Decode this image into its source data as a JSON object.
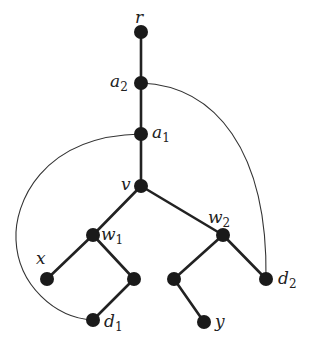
{
  "diagram": {
    "type": "rooted tree with back edges",
    "nodes": [
      {
        "id": "r",
        "label": "r",
        "sub": "",
        "x": 141,
        "y": 32
      },
      {
        "id": "a2",
        "label": "a",
        "sub": "2",
        "x": 141,
        "y": 83
      },
      {
        "id": "a1",
        "label": "a",
        "sub": "1",
        "x": 141,
        "y": 134
      },
      {
        "id": "v",
        "label": "v",
        "sub": "",
        "x": 141,
        "y": 186
      },
      {
        "id": "w1",
        "label": "w",
        "sub": "1",
        "x": 93,
        "y": 235
      },
      {
        "id": "w2",
        "label": "w",
        "sub": "2",
        "x": 223,
        "y": 235
      },
      {
        "id": "x",
        "label": "x",
        "sub": "",
        "x": 47,
        "y": 279
      },
      {
        "id": "n1",
        "label": "",
        "sub": "",
        "x": 134,
        "y": 279
      },
      {
        "id": "d1",
        "label": "d",
        "sub": "1",
        "x": 93,
        "y": 320
      },
      {
        "id": "n2",
        "label": "",
        "sub": "",
        "x": 174,
        "y": 279
      },
      {
        "id": "d2",
        "label": "d",
        "sub": "2",
        "x": 266,
        "y": 279
      },
      {
        "id": "y",
        "label": "y",
        "sub": "",
        "x": 204,
        "y": 322
      }
    ],
    "tree_edges": [
      [
        "r",
        "a2"
      ],
      [
        "a2",
        "a1"
      ],
      [
        "a1",
        "v"
      ],
      [
        "v",
        "w1"
      ],
      [
        "v",
        "w2"
      ],
      [
        "w1",
        "x"
      ],
      [
        "w1",
        "n1"
      ],
      [
        "n1",
        "d1"
      ],
      [
        "w2",
        "n2"
      ],
      [
        "w2",
        "d2"
      ],
      [
        "n2",
        "y"
      ]
    ],
    "back_edges": [
      {
        "from": "a2",
        "to": "d2"
      },
      {
        "from": "a1",
        "to": "d1"
      }
    ],
    "labels": {
      "r": {
        "main": "r",
        "sub": "",
        "x": 135,
        "y": 23
      },
      "a2": {
        "main": "a",
        "sub": "2",
        "x": 110,
        "y": 87
      },
      "a1": {
        "main": "a",
        "sub": "1",
        "x": 152,
        "y": 138
      },
      "v": {
        "main": "v",
        "sub": "",
        "x": 121,
        "y": 190
      },
      "w1": {
        "main": "w",
        "sub": "1",
        "x": 101,
        "y": 240
      },
      "w2": {
        "main": "w",
        "sub": "2",
        "x": 208,
        "y": 223
      },
      "x": {
        "main": "x",
        "sub": "",
        "x": 36,
        "y": 264
      },
      "d1": {
        "main": "d",
        "sub": "1",
        "x": 104,
        "y": 327
      },
      "d2": {
        "main": "d",
        "sub": "2",
        "x": 278,
        "y": 284
      },
      "y": {
        "main": "y",
        "sub": "",
        "x": 215,
        "y": 327
      }
    }
  }
}
